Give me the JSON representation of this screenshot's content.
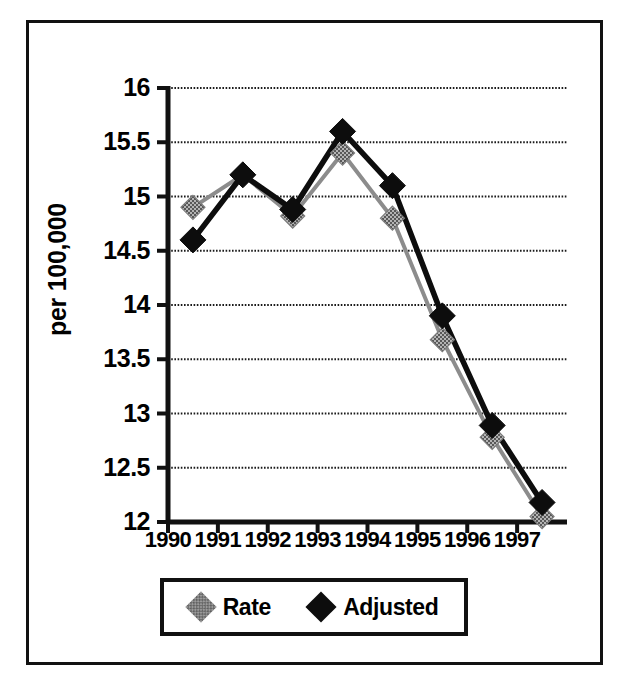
{
  "figure": {
    "y_axis_title": "per 100,000",
    "frame_color": "#111111"
  },
  "legend": {
    "entries": [
      {
        "label": "Rate",
        "marker": "diamond-gray-dithered",
        "color": "#9a9a9a"
      },
      {
        "label": "Adjusted",
        "marker": "diamond-solid-black",
        "color": "#0d0d0d"
      }
    ]
  },
  "chart_data": {
    "type": "line",
    "title": "",
    "subtitle": "",
    "xlabel": "",
    "ylabel": "per 100,000",
    "x": [
      1990.5,
      1991.5,
      1992.5,
      1993.5,
      1994.5,
      1995.5,
      1996.5,
      1997.5
    ],
    "xtick_values": [
      1990,
      1991,
      1992,
      1993,
      1994,
      1995,
      1996,
      1997
    ],
    "xtick_labels": [
      "1990",
      "1991",
      "1992",
      "1993",
      "1994",
      "1995",
      "1996",
      "1997"
    ],
    "xlim": [
      1990,
      1998
    ],
    "ytick_values": [
      12,
      12.5,
      13,
      13.5,
      14,
      14.5,
      15,
      15.5,
      16
    ],
    "ytick_labels": [
      "12",
      "12.5",
      "13",
      "13.5",
      "14",
      "14.5",
      "15",
      "15.5",
      "16"
    ],
    "ylim": [
      12,
      16
    ],
    "grid": "horizontal-dotted",
    "legend_position": "below-plot",
    "series": [
      {
        "name": "Rate",
        "color": "#9a9a9a",
        "marker": "diamond",
        "values": [
          14.9,
          15.2,
          14.82,
          15.4,
          14.8,
          13.68,
          12.78,
          12.05
        ]
      },
      {
        "name": "Adjusted",
        "color": "#0d0d0d",
        "marker": "diamond",
        "values": [
          14.6,
          15.2,
          14.88,
          15.6,
          15.1,
          13.9,
          12.89,
          12.18
        ]
      }
    ]
  }
}
